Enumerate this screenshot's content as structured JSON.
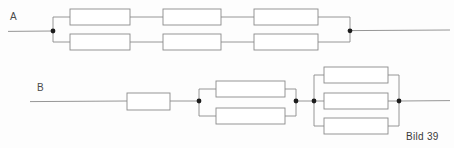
{
  "figure": {
    "caption": "Bild 39",
    "background_color": "#fdfdfd",
    "line_color": "#8a8a8a",
    "node_color": "#1c1c1c"
  },
  "circuits": [
    {
      "id": "circuit-a",
      "terminal_label": "A",
      "description": "Three series-connected groups, each group made of two resistors in parallel",
      "lead_in": {
        "x1": 8,
        "y1": 31,
        "x2": 53,
        "y2": 31
      },
      "lead_out": {
        "x1": 350,
        "y1": 31,
        "x2": 450,
        "y2": 31
      },
      "nodes": [
        {
          "name": "node-a-left",
          "x": 53,
          "y": 31
        },
        {
          "name": "node-a-right",
          "x": 350,
          "y": 31
        }
      ],
      "branch_rows_y": [
        17,
        42
      ],
      "resistors": [
        {
          "name": "resistor-a1",
          "x": 70,
          "y": 9,
          "w": 60,
          "h": 16
        },
        {
          "name": "resistor-a2",
          "x": 163,
          "y": 9,
          "w": 58,
          "h": 16
        },
        {
          "name": "resistor-a3",
          "x": 254,
          "y": 9,
          "w": 64,
          "h": 16
        },
        {
          "name": "resistor-a4",
          "x": 70,
          "y": 34,
          "w": 60,
          "h": 16
        },
        {
          "name": "resistor-a5",
          "x": 163,
          "y": 34,
          "w": 58,
          "h": 16
        },
        {
          "name": "resistor-a6",
          "x": 254,
          "y": 34,
          "w": 64,
          "h": 16
        }
      ]
    },
    {
      "id": "circuit-b",
      "terminal_label": "B",
      "description": "One series resistor, then a two-resistor parallel group, then a three-resistor parallel group",
      "lead_in": {
        "x1": 30,
        "y1": 101,
        "x2": 127,
        "y2": 101
      },
      "lead_out": {
        "x1": 399,
        "y1": 101,
        "x2": 450,
        "y2": 101
      },
      "nodes": [
        {
          "name": "node-b-1",
          "x": 199,
          "y": 101
        },
        {
          "name": "node-b-2",
          "x": 296,
          "y": 101
        },
        {
          "name": "node-b-3",
          "x": 314,
          "y": 101
        },
        {
          "name": "node-b-4",
          "x": 399,
          "y": 101
        }
      ],
      "resistors": [
        {
          "name": "resistor-b-series",
          "x": 127,
          "y": 93,
          "w": 43,
          "h": 17
        },
        {
          "name": "resistor-b-par2-top",
          "x": 216,
          "y": 81,
          "w": 69,
          "h": 16
        },
        {
          "name": "resistor-b-par2-bottom",
          "x": 216,
          "y": 108,
          "w": 69,
          "h": 16
        },
        {
          "name": "resistor-b-par3-top",
          "x": 324,
          "y": 67,
          "w": 64,
          "h": 16
        },
        {
          "name": "resistor-b-par3-middle",
          "x": 324,
          "y": 93,
          "w": 64,
          "h": 16
        },
        {
          "name": "resistor-b-par3-bottom",
          "x": 324,
          "y": 118,
          "w": 64,
          "h": 16
        }
      ]
    }
  ]
}
